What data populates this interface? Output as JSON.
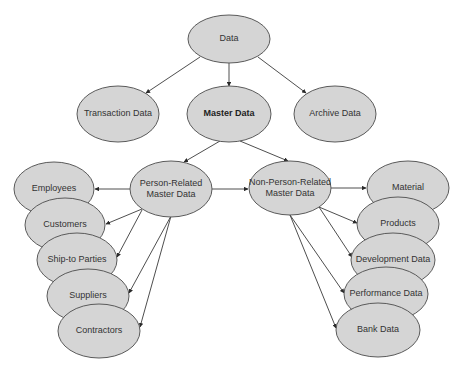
{
  "diagram": {
    "colors": {
      "fill": "#d5d5d5",
      "stroke": "#5a5a5a",
      "edge": "#3a3a3a",
      "text": "#333333"
    },
    "nodes": [
      {
        "id": "data",
        "label": [
          "Data"
        ],
        "cx": 229,
        "cy": 39,
        "rx": 41,
        "ry": 24,
        "bold": false
      },
      {
        "id": "transaction",
        "label": [
          "Transaction Data"
        ],
        "cx": 118,
        "cy": 114,
        "rx": 41,
        "ry": 28,
        "bold": false
      },
      {
        "id": "master",
        "label": [
          "Master Data"
        ],
        "cx": 229,
        "cy": 114,
        "rx": 42,
        "ry": 28,
        "bold": true
      },
      {
        "id": "archive",
        "label": [
          "Archive Data"
        ],
        "cx": 335,
        "cy": 114,
        "rx": 41,
        "ry": 28,
        "bold": false
      },
      {
        "id": "person",
        "label": [
          "Person-Related",
          "Master Data"
        ],
        "cx": 171,
        "cy": 189,
        "rx": 41,
        "ry": 28,
        "bold": false
      },
      {
        "id": "nonperson",
        "label": [
          "Non-Person-Related",
          "Master Data"
        ],
        "cx": 290,
        "cy": 188,
        "rx": 41,
        "ry": 27,
        "bold": false
      },
      {
        "id": "employees",
        "label": [
          "Employees"
        ],
        "cx": 54,
        "cy": 189,
        "rx": 40,
        "ry": 27,
        "bold": false
      },
      {
        "id": "customers",
        "label": [
          "Customers"
        ],
        "cx": 65,
        "cy": 225,
        "rx": 40,
        "ry": 27,
        "bold": false
      },
      {
        "id": "shipto",
        "label": [
          "Ship-to Parties"
        ],
        "cx": 77,
        "cy": 260,
        "rx": 40,
        "ry": 27,
        "bold": false
      },
      {
        "id": "suppliers",
        "label": [
          "Suppliers"
        ],
        "cx": 88,
        "cy": 296,
        "rx": 41,
        "ry": 27,
        "bold": false
      },
      {
        "id": "contractors",
        "label": [
          "Contractors"
        ],
        "cx": 99,
        "cy": 331,
        "rx": 41,
        "ry": 27,
        "bold": false
      },
      {
        "id": "material",
        "label": [
          "Material"
        ],
        "cx": 408,
        "cy": 188,
        "rx": 41,
        "ry": 27,
        "bold": false
      },
      {
        "id": "products",
        "label": [
          "Products"
        ],
        "cx": 398,
        "cy": 224,
        "rx": 41,
        "ry": 27,
        "bold": false
      },
      {
        "id": "development",
        "label": [
          "Development Data"
        ],
        "cx": 393,
        "cy": 260,
        "rx": 42,
        "ry": 27,
        "bold": false
      },
      {
        "id": "performance",
        "label": [
          "Performance Data"
        ],
        "cx": 386,
        "cy": 294,
        "rx": 42,
        "ry": 27,
        "bold": false
      },
      {
        "id": "bank",
        "label": [
          "Bank Data"
        ],
        "cx": 378,
        "cy": 330,
        "rx": 42,
        "ry": 27,
        "bold": false
      }
    ],
    "edges": [
      {
        "from": "data",
        "to": "transaction",
        "x1": 200,
        "y1": 57,
        "x2": 146,
        "y2": 93
      },
      {
        "from": "data",
        "to": "master",
        "x1": 229,
        "y1": 63,
        "x2": 229,
        "y2": 86
      },
      {
        "from": "data",
        "to": "archive",
        "x1": 258,
        "y1": 57,
        "x2": 306,
        "y2": 93
      },
      {
        "from": "master",
        "to": "person",
        "x1": 220,
        "y1": 141,
        "x2": 184,
        "y2": 162
      },
      {
        "from": "master",
        "to": "nonperson",
        "x1": 240,
        "y1": 141,
        "x2": 288,
        "y2": 161
      },
      {
        "from": "person",
        "to": "employees",
        "x1": 130,
        "y1": 189,
        "x2": 95,
        "y2": 189
      },
      {
        "from": "person",
        "to": "nonperson",
        "x1": 212,
        "y1": 189,
        "x2": 248,
        "y2": 189
      },
      {
        "from": "nonperson",
        "to": "material",
        "x1": 331,
        "y1": 188,
        "x2": 366,
        "y2": 188
      },
      {
        "from": "person",
        "to": "customers",
        "x1": 142,
        "y1": 209,
        "x2": 106,
        "y2": 224
      },
      {
        "from": "person",
        "to": "shipto",
        "x1": 142,
        "y1": 210,
        "x2": 117,
        "y2": 257
      },
      {
        "from": "person",
        "to": "suppliers",
        "x1": 171,
        "y1": 216,
        "x2": 129,
        "y2": 293
      },
      {
        "from": "person",
        "to": "contractors",
        "x1": 171,
        "y1": 216,
        "x2": 140,
        "y2": 327
      },
      {
        "from": "nonperson",
        "to": "products",
        "x1": 319,
        "y1": 207,
        "x2": 357,
        "y2": 223
      },
      {
        "from": "nonperson",
        "to": "development",
        "x1": 319,
        "y1": 207,
        "x2": 352,
        "y2": 257
      },
      {
        "from": "nonperson",
        "to": "performance",
        "x1": 290,
        "y1": 215,
        "x2": 344,
        "y2": 293
      },
      {
        "from": "nonperson",
        "to": "bank",
        "x1": 290,
        "y1": 215,
        "x2": 336,
        "y2": 328
      }
    ]
  }
}
